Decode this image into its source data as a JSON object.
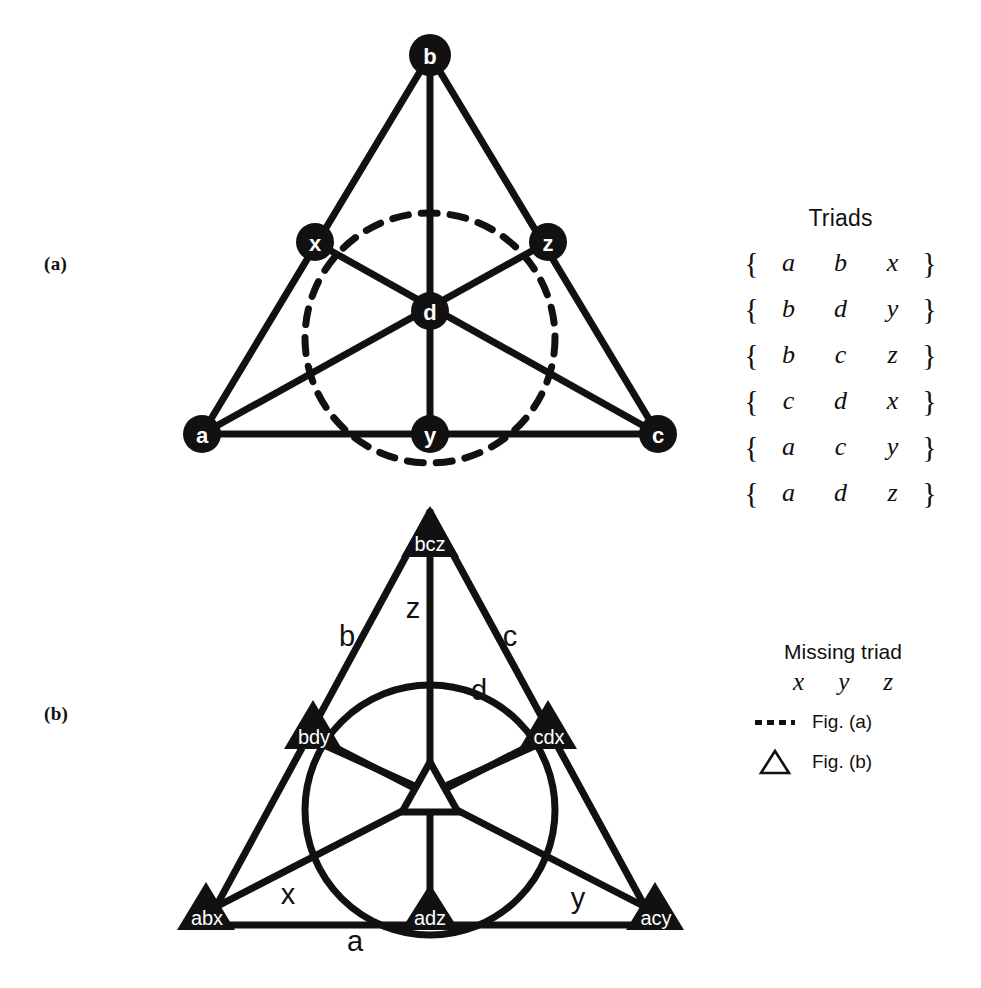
{
  "figure": {
    "panel_a_tag": "(a)",
    "panel_b_tag": "(b)"
  },
  "diagram_a": {
    "caption": "(a)",
    "node_labels": [
      "b",
      "x",
      "z",
      "d",
      "a",
      "y",
      "c"
    ],
    "nodes": [
      {
        "id": "b",
        "label": "b",
        "x": 430,
        "y": 55
      },
      {
        "id": "x",
        "label": "x",
        "x": 315,
        "y": 242
      },
      {
        "id": "z",
        "label": "z",
        "x": 548,
        "y": 242
      },
      {
        "id": "d",
        "label": "d",
        "x": 430,
        "y": 311
      },
      {
        "id": "a",
        "label": "a",
        "x": 202,
        "y": 434
      },
      {
        "id": "y",
        "label": "y",
        "x": 430,
        "y": 434
      },
      {
        "id": "c",
        "label": "c",
        "x": 658,
        "y": 434
      }
    ],
    "lines": [
      [
        "a",
        "b"
      ],
      [
        "b",
        "c"
      ],
      [
        "a",
        "c"
      ],
      [
        "b",
        "y"
      ],
      [
        "a",
        "z"
      ],
      [
        "c",
        "x"
      ]
    ],
    "circle": {
      "cx": 430,
      "cy": 338,
      "r": 125,
      "style": "dashed"
    }
  },
  "diagram_b": {
    "caption": "(b)",
    "node_labels": [
      "bcz",
      "bdy",
      "cdx",
      "abx",
      "adz",
      "acy"
    ],
    "nodes": [
      {
        "id": "bcz",
        "label": "bcz",
        "x": 430,
        "y": 532
      },
      {
        "id": "bdy",
        "label": "bdy",
        "x": 313,
        "y": 725
      },
      {
        "id": "cdx",
        "label": "cdx",
        "x": 548,
        "y": 725
      },
      {
        "id": "abx",
        "label": "abx",
        "x": 206,
        "y": 907
      },
      {
        "id": "adz",
        "label": "adz",
        "x": 430,
        "y": 907
      },
      {
        "id": "acy",
        "label": "acy",
        "x": 655,
        "y": 907
      }
    ],
    "center_node": {
      "id": "center",
      "label": "",
      "x": 430,
      "y": 790,
      "style": "hollow-triangle"
    },
    "edge_labels": [
      {
        "label": "z",
        "x": 413,
        "y": 608
      },
      {
        "label": "b",
        "x": 347,
        "y": 636
      },
      {
        "label": "c",
        "x": 510,
        "y": 636
      },
      {
        "label": "d",
        "x": 479,
        "y": 690
      },
      {
        "label": "x",
        "x": 288,
        "y": 894
      },
      {
        "label": "y",
        "x": 578,
        "y": 898
      },
      {
        "label": "a",
        "x": 355,
        "y": 941
      }
    ],
    "circle": {
      "cx": 430,
      "cy": 810,
      "r": 125,
      "style": "solid"
    }
  },
  "triads": {
    "title": "Triads",
    "open_brace": "{",
    "close_brace": "}",
    "rows": [
      [
        "a",
        "b",
        "x"
      ],
      [
        "b",
        "d",
        "y"
      ],
      [
        "b",
        "c",
        "z"
      ],
      [
        "c",
        "d",
        "x"
      ],
      [
        "a",
        "c",
        "y"
      ],
      [
        "a",
        "d",
        "z"
      ]
    ]
  },
  "legend": {
    "title": "Missing triad",
    "variables": [
      "x",
      "y",
      "z"
    ],
    "entries": [
      {
        "key": "dashed-line",
        "label": "Fig. (a)"
      },
      {
        "key": "hollow-triangle",
        "label": "Fig. (b)"
      }
    ]
  },
  "colors": {
    "ink": "#111111",
    "paper": "#ffffff"
  }
}
